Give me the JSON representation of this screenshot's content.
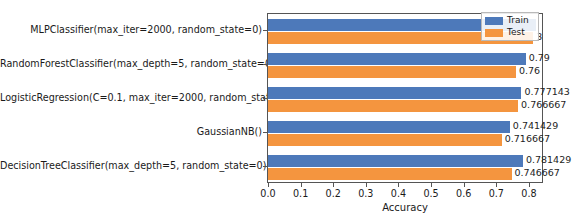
{
  "chart_data": {
    "type": "bar",
    "orientation": "horizontal",
    "title": "",
    "xlabel": "Accuracy",
    "ylabel": "",
    "xlim": [
      0.0,
      0.84
    ],
    "xticks": [
      "0.0",
      "0.1",
      "0.2",
      "0.3",
      "0.4",
      "0.5",
      "0.6",
      "0.7",
      "0.8"
    ],
    "xtick_values": [
      0.0,
      0.1,
      0.2,
      0.3,
      0.4,
      0.5,
      0.6,
      0.7,
      0.8
    ],
    "grid": false,
    "legend_position": "upper right",
    "categories": [
      "MLPClassifier(max_iter=2000, random_state=0)",
      "RandomForestClassifier(max_depth=5, random_state=0)",
      "LogisticRegression(C=0.1, max_iter=2000, random_state=0)",
      "GaussianNB()",
      "DecisionTreeClassifier(max_depth=5, random_state=0)"
    ],
    "series": [
      {
        "name": "Train",
        "color": "#4d79ba",
        "values": [
          0.822857,
          0.79,
          0.777143,
          0.741429,
          0.781429
        ],
        "labels": [
          "",
          "0.79",
          "0.777143",
          "0.741429",
          "0.781429"
        ]
      },
      {
        "name": "Test",
        "color": "#f4953f",
        "values": [
          0.813333,
          0.76,
          0.766667,
          0.716667,
          0.746667
        ],
        "labels": [
          "3",
          "0.76",
          "0.766667",
          "0.716667",
          "0.746667"
        ]
      }
    ]
  },
  "legend": {
    "entries": [
      {
        "label": "Train",
        "color": "#4d79ba"
      },
      {
        "label": "Test",
        "color": "#f4953f"
      }
    ]
  }
}
